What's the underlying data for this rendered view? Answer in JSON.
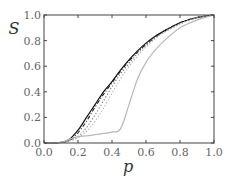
{
  "chart_data": {
    "type": "line",
    "title": "",
    "xlabel": "p",
    "ylabel": "S",
    "xlim": [
      0.0,
      1.0
    ],
    "ylim": [
      0.0,
      1.0
    ],
    "grid": false,
    "legend": null,
    "x_ticks": [
      "0.0",
      "0.2",
      "0.4",
      "0.6",
      "0.8",
      "1.0"
    ],
    "y_ticks": [
      "0.0",
      "0.2",
      "0.4",
      "0.6",
      "0.8",
      "1.0"
    ],
    "x": [
      0.0,
      0.1,
      0.15,
      0.2,
      0.25,
      0.3,
      0.35,
      0.4,
      0.45,
      0.5,
      0.55,
      0.6,
      0.65,
      0.7,
      0.8,
      0.9,
      1.0
    ],
    "series": [
      {
        "name": "solid-black",
        "style": "solid",
        "color": "#111111",
        "values": [
          0.0,
          0.005,
          0.03,
          0.1,
          0.2,
          0.3,
          0.4,
          0.48,
          0.57,
          0.65,
          0.72,
          0.78,
          0.83,
          0.87,
          0.94,
          0.98,
          1.0
        ]
      },
      {
        "name": "dashdot-black",
        "style": "dashdot",
        "color": "#222222",
        "values": [
          0.0,
          0.005,
          0.02,
          0.08,
          0.17,
          0.28,
          0.38,
          0.47,
          0.56,
          0.64,
          0.71,
          0.77,
          0.82,
          0.87,
          0.94,
          0.98,
          1.0
        ]
      },
      {
        "name": "dotted-dark",
        "style": "dotted",
        "color": "#777777",
        "values": [
          0.0,
          0.004,
          0.02,
          0.05,
          0.12,
          0.22,
          0.33,
          0.44,
          0.54,
          0.62,
          0.7,
          0.76,
          0.82,
          0.86,
          0.93,
          0.98,
          1.0
        ]
      },
      {
        "name": "dotted-light",
        "style": "dotted",
        "color": "#aaaaaa",
        "values": [
          0.0,
          0.004,
          0.015,
          0.04,
          0.09,
          0.17,
          0.27,
          0.39,
          0.5,
          0.6,
          0.68,
          0.75,
          0.81,
          0.86,
          0.93,
          0.98,
          1.0
        ]
      },
      {
        "name": "solid-light-gray",
        "style": "solid",
        "color": "#b8b8b8",
        "values": [
          0.0,
          0.005,
          0.03,
          0.05,
          0.055,
          0.065,
          0.075,
          0.085,
          0.11,
          0.3,
          0.5,
          0.63,
          0.72,
          0.79,
          0.9,
          0.96,
          1.0
        ]
      }
    ]
  }
}
